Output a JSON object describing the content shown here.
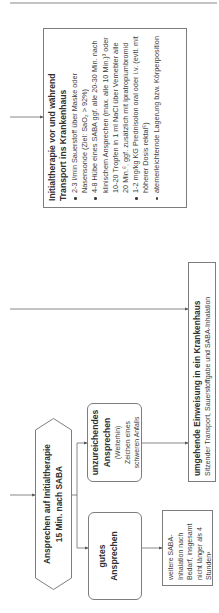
{
  "diagram": {
    "initial_therapy_box": {
      "title": "Initialtherapie vor und während Transport ins Krankenhaus",
      "bullets": [
        "2-3 l/min Sauerstoff über Maske oder Nasensonde (Ziel: SaO₂ > 92%)",
        "4-8 Hübe eines SABA ggf. alle 20-30 Min. nach klinischem Ansprechen (max. alle 10 Min.)³ oder 10-20 Tropfen in 1 ml NaCl über Vernebler alle 20 Min.⁶, ggf. zusätzlich mit Ipratropiumbromid",
        "1-2 mg/kg KG Prednisolon oral oder i.v. (evtl. mit höherer Dosis rektal⁵)",
        "atemerleichternde Lagerung bzw. Körperposition"
      ]
    },
    "hospital_box": {
      "title": "umgehende Einweisung in ein Krankenhaus",
      "detail": "Sitzender Transport, Sauerstoffgabe und SABA-Inhalation"
    },
    "decision": {
      "line1": "Ansprechen auf Initialtherapie",
      "line2": "15 Min. nach SABA"
    },
    "good_response": {
      "line1": "gutes",
      "line2": "Ansprechen"
    },
    "insufficient_response": {
      "line1": "unzureichendes",
      "line2": "Ansprechen",
      "detail1": "(Weiterhin)",
      "detail2": "Zeichen eines",
      "detail3": "schweren Anfalls"
    },
    "further_saba": {
      "text": "weitere SABA-Inhalation nach Bedarf, insgesamt nicht länger als 4 Stunden³"
    }
  },
  "colors": {
    "text": "#3c3c3c",
    "border": "#7d7d7d",
    "connector": "#6a6a6a",
    "background": "#ffffff"
  }
}
